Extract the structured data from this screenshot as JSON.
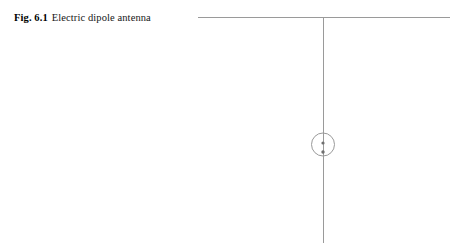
{
  "page": {
    "background_color": "#ffffff",
    "width": 457,
    "height": 245
  },
  "caption": {
    "figure_label": "Fig. 6.1",
    "figure_text": "Electric dipole antenna",
    "full_text": "Fig. 6.1 Electric dipole antenna"
  },
  "figure": {
    "name": "electric-dipole-antenna-diagram",
    "line_color": "#9a9a9a",
    "dot_color": "#6f6f6f",
    "horizontal_line": {
      "label": "ground-plane-line",
      "x1": 198,
      "y1": 17,
      "x2": 450,
      "y2": 17
    },
    "vertical_line": {
      "label": "antenna-element-line",
      "x1": 323,
      "y1": 17,
      "x2": 323,
      "y2": 243
    },
    "feed_circle": {
      "label": "source-circle",
      "cx": 323,
      "cy": 144.5,
      "r": 11.5
    },
    "feed_dots": [
      {
        "label": "source-center-dot",
        "cx": 323,
        "cy": 143,
        "r": 1.6
      },
      {
        "label": "source-lower-dot",
        "cx": 323,
        "cy": 152,
        "r": 1.7
      }
    ]
  }
}
